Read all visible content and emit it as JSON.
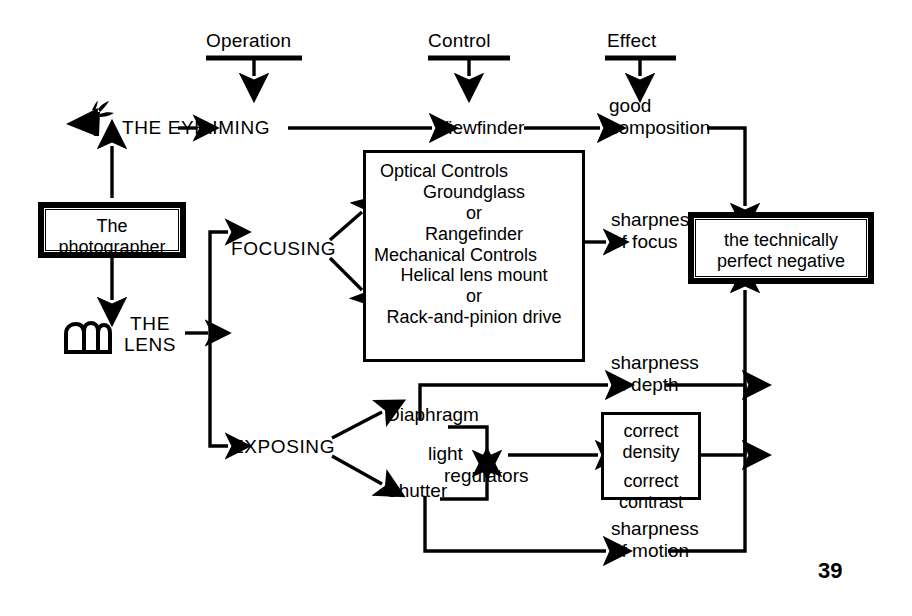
{
  "diagram": {
    "title_columns": [
      {
        "id": "operation",
        "label": "Operation"
      },
      {
        "id": "control",
        "label": "Control"
      },
      {
        "id": "effect",
        "label": "Effect"
      }
    ],
    "source_box": {
      "line1": "The",
      "line2": "photographer"
    },
    "actors": [
      {
        "id": "eye",
        "label": "THE EYE",
        "icon": "eye-icon"
      },
      {
        "id": "lens",
        "label": "THE\nLENS",
        "icon": "lens-icon"
      }
    ],
    "operations": [
      {
        "id": "aiming",
        "label": "AIMING"
      },
      {
        "id": "focusing",
        "label": "FOCUSING"
      },
      {
        "id": "exposing",
        "label": "EXPOSING"
      }
    ],
    "controls": [
      {
        "id": "viewfinder",
        "label": "Viewfinder"
      },
      {
        "id": "diaphragm",
        "label": "Diaphragm"
      },
      {
        "id": "shutter",
        "label": "Shutter"
      },
      {
        "id": "light-regulators",
        "label": "light",
        "label2": "regulators"
      }
    ],
    "controls_box": {
      "lines": [
        "Optical Controls",
        "Groundglass",
        "or",
        "Rangefinder",
        "Mechanical Controls",
        "Helical lens mount",
        "or",
        "Rack-and-pinion drive"
      ]
    },
    "density_box": {
      "lines": [
        "correct",
        "density",
        "correct",
        "contrast"
      ]
    },
    "effects": [
      {
        "id": "good-composition",
        "l1": "good",
        "l2": "composition"
      },
      {
        "id": "sharpness-of-focus",
        "l1": "sharpness",
        "l2": "of focus"
      },
      {
        "id": "sharpness-in-depth",
        "l1": "sharpness",
        "l2": "in depth"
      },
      {
        "id": "sharpness-of-motion",
        "l1": "sharpness",
        "l2": "of motion"
      }
    ],
    "result_box": {
      "line1": "the technically",
      "line2": "perfect negative"
    },
    "page_number": "39",
    "colors": {
      "ink": "#000000",
      "paper": "#ffffff"
    }
  }
}
